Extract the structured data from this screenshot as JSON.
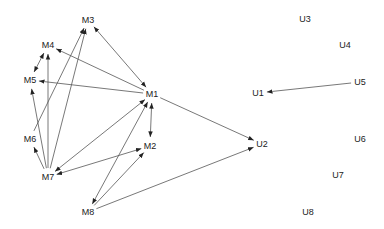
{
  "diagram": {
    "type": "directed-graph",
    "colors": {
      "edge": "#555555",
      "label": "#222222",
      "background": "#ffffff"
    },
    "nodes": [
      {
        "id": "M1",
        "label": "M1",
        "x": 152,
        "y": 94
      },
      {
        "id": "M2",
        "label": "M2",
        "x": 150,
        "y": 146
      },
      {
        "id": "M3",
        "label": "M3",
        "x": 88,
        "y": 20
      },
      {
        "id": "M4",
        "label": "M4",
        "x": 48,
        "y": 45
      },
      {
        "id": "M5",
        "label": "M5",
        "x": 30,
        "y": 80
      },
      {
        "id": "M6",
        "label": "M6",
        "x": 30,
        "y": 139
      },
      {
        "id": "M7",
        "label": "M7",
        "x": 48,
        "y": 177
      },
      {
        "id": "M8",
        "label": "M8",
        "x": 88,
        "y": 212
      },
      {
        "id": "U1",
        "label": "U1",
        "x": 258,
        "y": 93
      },
      {
        "id": "U2",
        "label": "U2",
        "x": 262,
        "y": 144
      },
      {
        "id": "U3",
        "label": "U3",
        "x": 305,
        "y": 19
      },
      {
        "id": "U4",
        "label": "U4",
        "x": 345,
        "y": 45
      },
      {
        "id": "U5",
        "label": "U5",
        "x": 360,
        "y": 82
      },
      {
        "id": "U6",
        "label": "U6",
        "x": 360,
        "y": 139
      },
      {
        "id": "U7",
        "label": "U7",
        "x": 338,
        "y": 175
      },
      {
        "id": "U8",
        "label": "U8",
        "x": 308,
        "y": 212
      }
    ],
    "edges": [
      {
        "from": "M1",
        "to": "M3",
        "bidirectional": true
      },
      {
        "from": "M1",
        "to": "M4",
        "bidirectional": false
      },
      {
        "from": "M1",
        "to": "M5",
        "bidirectional": false
      },
      {
        "from": "M1",
        "to": "M2",
        "bidirectional": true
      },
      {
        "from": "M1",
        "to": "M7",
        "bidirectional": true
      },
      {
        "from": "M1",
        "to": "M8",
        "bidirectional": true
      },
      {
        "from": "M1",
        "to": "U2",
        "bidirectional": false
      },
      {
        "from": "M4",
        "to": "M5",
        "bidirectional": true
      },
      {
        "from": "M6",
        "to": "M3",
        "bidirectional": false
      },
      {
        "from": "M7",
        "to": "M3",
        "bidirectional": false
      },
      {
        "from": "M7",
        "to": "M4",
        "bidirectional": false
      },
      {
        "from": "M7",
        "to": "M5",
        "bidirectional": false
      },
      {
        "from": "M7",
        "to": "M6",
        "bidirectional": false
      },
      {
        "from": "M7",
        "to": "M2",
        "bidirectional": true
      },
      {
        "from": "M8",
        "to": "M2",
        "bidirectional": false
      },
      {
        "from": "M8",
        "to": "U2",
        "bidirectional": false
      },
      {
        "from": "U5",
        "to": "U1",
        "bidirectional": false
      }
    ]
  }
}
